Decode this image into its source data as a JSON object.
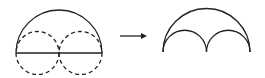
{
  "diagram": {
    "left_figure": {
      "outer": "semicircle",
      "inner": [
        "dashed-circle",
        "dashed-circle"
      ],
      "diameter": "solid-line"
    },
    "arrow": "right-arrow",
    "right_figure": {
      "outer": "semicircle-arc",
      "inner": [
        "small-arc",
        "small-arc"
      ]
    },
    "colors": {
      "stroke": "#222222",
      "background": "#ffffff"
    }
  }
}
